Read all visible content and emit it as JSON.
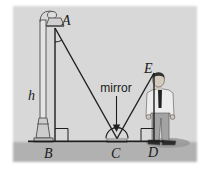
{
  "figure": {
    "labels": {
      "point_a": "A",
      "point_b": "B",
      "point_c": "C",
      "point_d": "D",
      "point_e": "E",
      "height": "h",
      "mirror": "mirror"
    },
    "colors": {
      "background": "#d8d8d8",
      "ground": "#b1b1b1",
      "line": "#1f1f1f",
      "shadow": "#989898"
    }
  }
}
